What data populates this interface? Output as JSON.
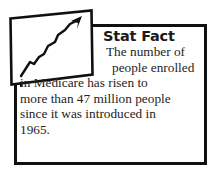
{
  "callout": {
    "kind": "stat-fact-callout",
    "title": "Stat Fact",
    "icon": "rising-line-chart-icon",
    "body_lines": [
      "The number of",
      "people enrolled",
      "in Medicare has risen to",
      "more than 47 million people",
      "since it was introduced in",
      "1965."
    ],
    "body_full_text": "The number of people enrolled in Medicare has risen to more than 47 million people since it was introduced in 1965.",
    "colors": {
      "border": "#101010",
      "title_text": "#1b1b1b",
      "body_text": "#242424",
      "background": "#ffffff",
      "icon_stroke": "#101010"
    }
  }
}
